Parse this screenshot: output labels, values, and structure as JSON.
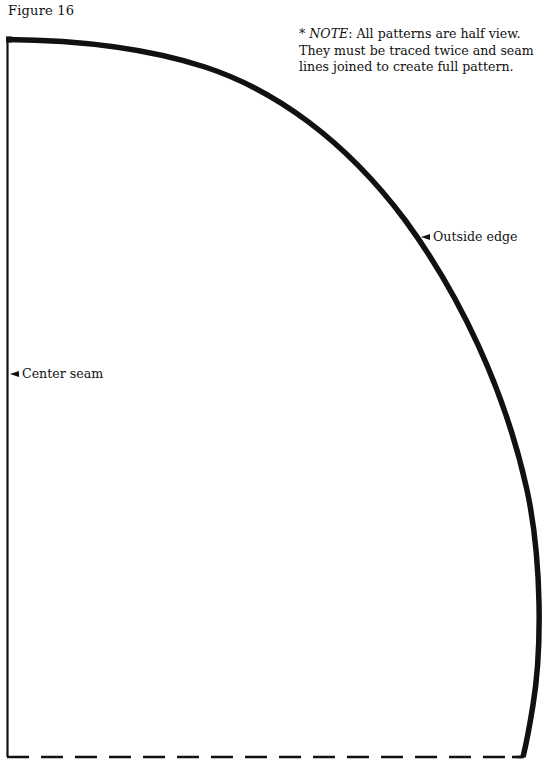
{
  "figure": {
    "title": "Figure 16"
  },
  "note": {
    "prefix": "* ",
    "heading": "NOTE",
    "text": ": All patterns are half view. They must be traced twice and seam lines joined to create full pattern."
  },
  "labels": {
    "outside_edge": "Outside edge",
    "center_seam": "Center seam"
  },
  "pattern": {
    "stroke_color": "#111111",
    "background_color": "#ffffff",
    "edges": [
      {
        "name": "outside-edge",
        "style": "solid-thick"
      },
      {
        "name": "center-seam",
        "style": "solid-thin"
      },
      {
        "name": "bottom-fold-line",
        "style": "dashed"
      }
    ]
  }
}
